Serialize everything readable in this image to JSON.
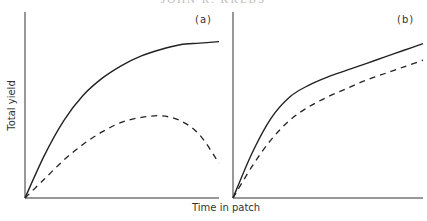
{
  "header": {
    "text": "JOHN R. KREBS"
  },
  "chart_data": [
    {
      "type": "line",
      "panel_label": "(a)",
      "xlabel": "Time in patch",
      "ylabel": "Total yield",
      "grid": false,
      "ticks": false,
      "series": [
        {
          "name": "solid",
          "style": "solid",
          "shape": "rises then saturates to a plateau",
          "x": [
            0,
            0.1,
            0.2,
            0.3,
            0.4,
            0.5,
            0.6,
            0.7,
            0.8,
            0.9,
            1.0
          ],
          "y": [
            0,
            0.27,
            0.49,
            0.65,
            0.76,
            0.84,
            0.9,
            0.94,
            0.97,
            0.98,
            0.99
          ]
        },
        {
          "name": "dashed",
          "style": "dashed",
          "shape": "rises to a peak then declines",
          "x": [
            0,
            0.1,
            0.2,
            0.3,
            0.4,
            0.5,
            0.6,
            0.7,
            0.8,
            0.9,
            1.0
          ],
          "y": [
            0,
            0.12,
            0.24,
            0.34,
            0.42,
            0.48,
            0.51,
            0.52,
            0.49,
            0.4,
            0.22
          ]
        }
      ]
    },
    {
      "type": "line",
      "panel_label": "(b)",
      "xlabel": "Time in patch",
      "ylabel": "Total yield",
      "grid": false,
      "ticks": false,
      "series": [
        {
          "name": "solid",
          "style": "solid",
          "shape": "rapid rise then slower steady increase",
          "x": [
            0,
            0.1,
            0.2,
            0.3,
            0.4,
            0.5,
            0.6,
            0.7,
            0.8,
            0.9,
            1.0
          ],
          "y": [
            0,
            0.27,
            0.48,
            0.61,
            0.68,
            0.73,
            0.77,
            0.81,
            0.85,
            0.89,
            0.93
          ]
        },
        {
          "name": "dashed",
          "style": "dashed",
          "shape": "rises below solid, steady increase",
          "x": [
            0,
            0.1,
            0.2,
            0.3,
            0.4,
            0.5,
            0.6,
            0.7,
            0.8,
            0.9,
            1.0
          ],
          "y": [
            0,
            0.19,
            0.35,
            0.47,
            0.55,
            0.61,
            0.66,
            0.71,
            0.75,
            0.79,
            0.83
          ]
        }
      ]
    }
  ]
}
